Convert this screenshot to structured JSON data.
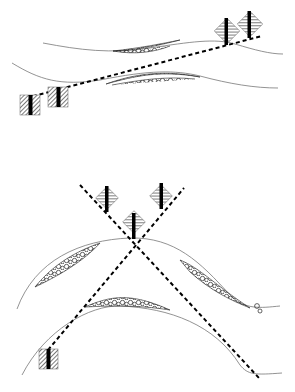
{
  "diagram": {
    "type": "geologic-cross-section-well-correlation",
    "panels": [
      {
        "id": "top",
        "description": "Gently dipping layered beds with lenticular gravel bodies; a straight dashed correlation line links two wells on the left to two tilted wells on the right",
        "wells": 4,
        "gravel_lenses": 2,
        "dashed_lines": 1
      },
      {
        "id": "bottom",
        "description": "Anticlinal (arched) beds with gravel lenses; two crossing dashed lines pass through tilted wells at the crest",
        "wells": 4,
        "gravel_lenses": 3,
        "dashed_lines": 2
      }
    ],
    "colors": {
      "background": "#ffffff",
      "bed_line": "#777777",
      "dashed_line": "#000000",
      "well_core": "#000000",
      "hatch": "#333333"
    }
  }
}
